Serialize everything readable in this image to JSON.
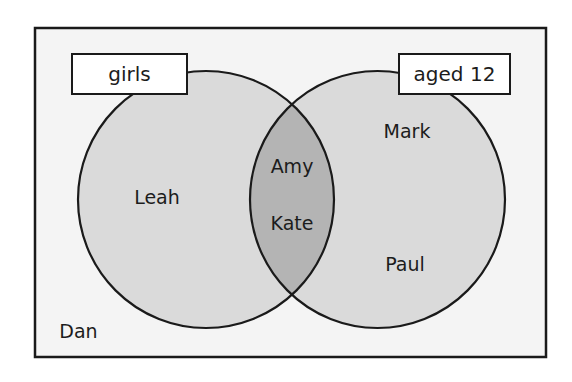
{
  "diagram": {
    "type": "venn",
    "universe": {
      "outside_members": [
        "Dan"
      ]
    },
    "sets": [
      {
        "id": "girls",
        "label": "girls",
        "only_members": [
          "Leah"
        ]
      },
      {
        "id": "aged12",
        "label": "aged 12",
        "only_members": [
          "Mark",
          "Paul"
        ]
      }
    ],
    "intersection": {
      "sets": [
        "girls",
        "aged12"
      ],
      "members": [
        "Amy",
        "Kate"
      ]
    },
    "colors": {
      "page_background": "#ffffff",
      "universe_fill": "#f4f4f4",
      "set_fill": "#dadada",
      "intersection_fill": "#b4b4b4",
      "stroke": "#1a1a1a",
      "label_box_fill": "#ffffff",
      "text": "#1c1c1c"
    }
  }
}
